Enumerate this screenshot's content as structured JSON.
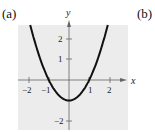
{
  "panels": [
    {
      "label": "(a)"
    },
    {
      "label": "(b)"
    }
  ],
  "chart_data": {
    "type": "line",
    "title": "",
    "function": "y = x^2 - 1",
    "xlabel": "x",
    "ylabel": "y",
    "xlim": [
      -2.5,
      2.8
    ],
    "ylim": [
      -2.4,
      2.7
    ],
    "x_ticks": [
      {
        "value": -2,
        "label": "−2"
      },
      {
        "value": -1,
        "label": "−1"
      },
      {
        "value": 1,
        "label": "1"
      },
      {
        "value": 2,
        "label": "2"
      }
    ],
    "y_ticks": [
      {
        "value": 2,
        "label": "2"
      },
      {
        "value": 1,
        "label": "1"
      },
      {
        "value": -2,
        "label": "−2"
      }
    ],
    "series": [
      {
        "name": "parabola",
        "x": [
          -1.9,
          -1.5,
          -1,
          -0.5,
          0,
          0.5,
          1,
          1.5,
          1.9
        ],
        "y": [
          2.61,
          1.25,
          0,
          -0.75,
          -1,
          -0.75,
          0,
          1.25,
          2.61
        ]
      }
    ],
    "grid": false,
    "background": "#ececec",
    "curve_color": "#111111"
  }
}
